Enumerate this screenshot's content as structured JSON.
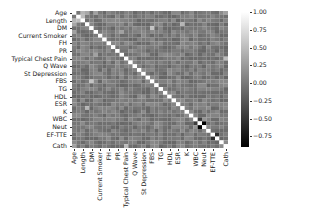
{
  "chart_data": {
    "type": "heatmap",
    "title": "",
    "xlabel": "",
    "ylabel": "",
    "colormap": "gray",
    "vmin": -0.9,
    "vmax": 1.0,
    "colorbar": {
      "ticks": [
        1.0,
        0.75,
        0.5,
        0.25,
        0.0,
        -0.25,
        -0.5,
        -0.75
      ],
      "tick_labels": [
        "1.00",
        "0.75",
        "0.50",
        "0.25",
        "0.00",
        "−0.25",
        "−0.50",
        "−0.75"
      ]
    },
    "variables": [
      "Age",
      "Weight",
      "Length",
      "Sex",
      "DM",
      "HTN",
      "Current Smoker",
      "EX-Smoker",
      "FH",
      "Obesity",
      "PR",
      "BP",
      "Typical Chest Pain",
      "Dyspnea",
      "Q Wave",
      "St Elevation",
      "St Depression",
      "Tinversion",
      "FBS",
      "CR",
      "TG",
      "LDL",
      "HDL",
      "BUN",
      "ESR",
      "HB",
      "K",
      "Na",
      "WBC",
      "Lymph",
      "Neut",
      "PLT",
      "EF-TTE",
      "Region RWMA",
      "VHD",
      "Cath"
    ],
    "tick_labels": [
      "Age",
      "Length",
      "DM",
      "Current Smoker",
      "FH",
      "PR",
      "Typical Chest Pain",
      "Q Wave",
      "St Depression",
      "FBS",
      "TG",
      "HDL",
      "ESR",
      "K",
      "WBC",
      "Neut",
      "EF-TTE",
      "Cath"
    ],
    "notable_values": [
      {
        "row": "Age",
        "col": "Length",
        "value": 0.45
      },
      {
        "row": "Weight",
        "col": "Length",
        "value": 0.5
      },
      {
        "row": "Age",
        "col": "Sex",
        "value": 0.35
      },
      {
        "row": "DM",
        "col": "FBS",
        "value": 0.55
      },
      {
        "row": "HTN",
        "col": "Age",
        "value": 0.3
      },
      {
        "row": "Current Smoker",
        "col": "EX-Smoker",
        "value": 0.1
      },
      {
        "row": "Typical Chest Pain",
        "col": "Cath",
        "value": 0.5
      },
      {
        "row": "BP",
        "col": "HTN",
        "value": 0.3
      },
      {
        "row": "HB",
        "col": "Sex",
        "value": 0.45
      },
      {
        "row": "WBC",
        "col": "Neut",
        "value": 0.2
      },
      {
        "row": "Lymph",
        "col": "Neut",
        "value": -0.9
      },
      {
        "row": "Lymph",
        "col": "WBC",
        "value": -0.45
      },
      {
        "row": "EF-TTE",
        "col": "Region RWMA",
        "value": -0.55
      },
      {
        "row": "Age",
        "col": "Cath",
        "value": 0.3
      }
    ]
  },
  "figure": {
    "background": "#ffffff",
    "text_color": "#222222"
  }
}
